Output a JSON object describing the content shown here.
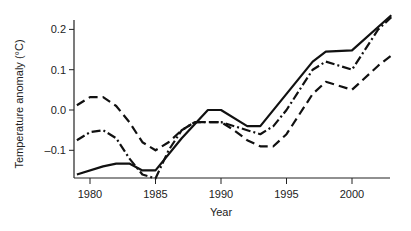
{
  "chart_data": {
    "type": "line",
    "title": "",
    "xlabel": "Year",
    "ylabel": "Temperature anomaly (°C)",
    "xlim": [
      1978.8,
      2003.2
    ],
    "ylim": [
      -0.17,
      0.23
    ],
    "xticks": [
      1980,
      1985,
      1990,
      1995,
      2000
    ],
    "yticks": [
      -0.1,
      0.0,
      0.1,
      0.2
    ],
    "ytick_labels": [
      "–0.1",
      "0.0",
      "0.1",
      "0.2"
    ],
    "grid": false,
    "legend": null,
    "series": [
      {
        "name": "solid",
        "style": "solid",
        "x": [
          1979,
          1981,
          1982,
          1983,
          1984,
          1985,
          1987,
          1989,
          1990,
          1992,
          1993,
          1995,
          1997,
          1998,
          2000,
          2003
        ],
        "values": [
          -0.16,
          -0.14,
          -0.133,
          -0.133,
          -0.15,
          -0.15,
          -0.07,
          0.0,
          0.0,
          -0.04,
          -0.04,
          0.04,
          0.12,
          0.145,
          0.148,
          0.235
        ]
      },
      {
        "name": "dash-dot",
        "style": "dashdot",
        "x": [
          1979,
          1980,
          1981,
          1982,
          1983,
          1984,
          1985,
          1986,
          1987,
          1988,
          1990,
          1992,
          1993,
          1994,
          1995,
          1997,
          1998,
          2000,
          2002,
          2003
        ],
        "values": [
          -0.075,
          -0.055,
          -0.05,
          -0.07,
          -0.12,
          -0.16,
          -0.17,
          -0.1,
          -0.05,
          -0.03,
          -0.03,
          -0.05,
          -0.06,
          -0.04,
          0.0,
          0.1,
          0.12,
          0.1,
          0.2,
          0.23
        ]
      },
      {
        "name": "dashed",
        "style": "dashed",
        "x": [
          1979,
          1980,
          1981,
          1982,
          1983,
          1984,
          1985,
          1986,
          1987,
          1988,
          1990,
          1991,
          1992,
          1993,
          1994,
          1995,
          1997,
          1998,
          2000,
          2002,
          2003
        ],
        "values": [
          0.012,
          0.032,
          0.032,
          0.01,
          -0.03,
          -0.08,
          -0.1,
          -0.08,
          -0.05,
          -0.03,
          -0.03,
          -0.05,
          -0.075,
          -0.09,
          -0.09,
          -0.06,
          0.04,
          0.07,
          0.05,
          0.11,
          0.135
        ]
      }
    ]
  }
}
